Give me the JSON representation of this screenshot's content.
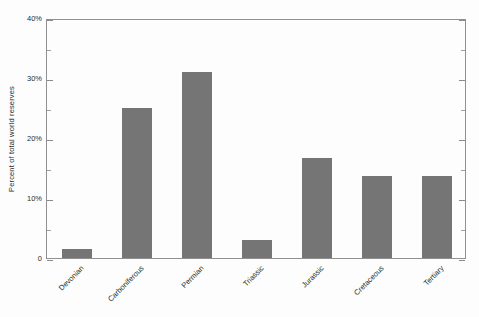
{
  "chart_data": {
    "type": "bar",
    "title": "",
    "xlabel": "",
    "ylabel": "Percent of total world reserves",
    "categories": [
      "Devonian",
      "Carboniferous",
      "Permian",
      "Triassic",
      "Jurassic",
      "Cretaceous",
      "Tertiary"
    ],
    "values": [
      1.5,
      25,
      31,
      3,
      16.7,
      13.7,
      13.7
    ],
    "ylim": [
      0,
      40
    ],
    "ytick_values": [
      0,
      10,
      20,
      30,
      40
    ],
    "ytick_labels": [
      "0",
      "10%",
      "20%",
      "30%",
      "40%"
    ],
    "yminor_values": [
      5,
      15,
      25,
      35
    ],
    "grid": false,
    "legend": null,
    "bar_color": "#757575",
    "axis_color": "#909090",
    "background_color": "#fdfdfd"
  }
}
